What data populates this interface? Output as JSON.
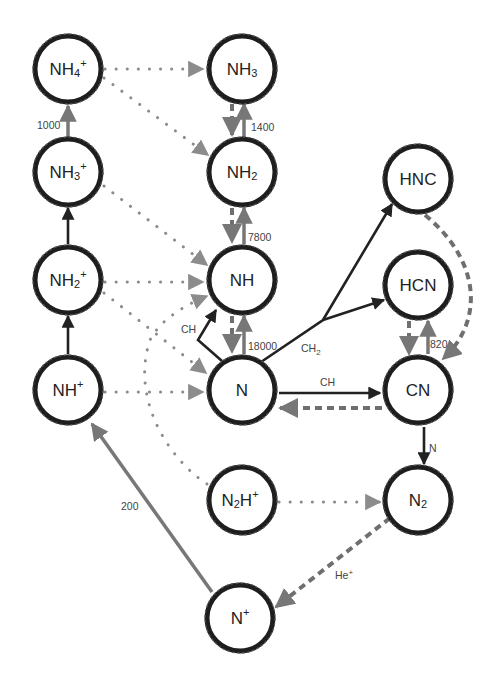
{
  "diagram": {
    "nodes": [
      {
        "id": "NH4+",
        "base": "NH",
        "sub": "4",
        "sup": "+",
        "x": 68,
        "y": 69
      },
      {
        "id": "NH3",
        "base": "NH",
        "sub": "3",
        "sup": "",
        "x": 242,
        "y": 69
      },
      {
        "id": "NH3+",
        "base": "NH",
        "sub": "3",
        "sup": "+",
        "x": 68,
        "y": 172
      },
      {
        "id": "NH2",
        "base": "NH",
        "sub": "2",
        "sup": "",
        "x": 242,
        "y": 172
      },
      {
        "id": "HNC",
        "base": "HNC",
        "sub": "",
        "sup": "",
        "x": 418,
        "y": 179
      },
      {
        "id": "NH2+",
        "base": "NH",
        "sub": "2",
        "sup": "+",
        "x": 68,
        "y": 280
      },
      {
        "id": "NH",
        "base": "NH",
        "sub": "",
        "sup": "",
        "x": 242,
        "y": 280
      },
      {
        "id": "HCN",
        "base": "HCN",
        "sub": "",
        "sup": "",
        "x": 418,
        "y": 285
      },
      {
        "id": "NH+",
        "base": "NH",
        "sub": "",
        "sup": "+",
        "x": 68,
        "y": 390
      },
      {
        "id": "N",
        "base": "N",
        "sub": "",
        "sup": "",
        "x": 242,
        "y": 390
      },
      {
        "id": "CN",
        "base": "CN",
        "sub": "",
        "sup": "",
        "x": 418,
        "y": 390
      },
      {
        "id": "N2H+",
        "base": "N",
        "sub": "2",
        "sup": "H+",
        "x": 242,
        "y": 500
      },
      {
        "id": "N2",
        "base": "N",
        "sub": "2",
        "sup": "",
        "x": 418,
        "y": 500
      },
      {
        "id": "N+",
        "base": "N",
        "sub": "",
        "sup": "+",
        "x": 240,
        "y": 618
      }
    ],
    "edge_labels": {
      "nh3p_nh4p": "1000",
      "nh2_nh3": "1400",
      "nh_nh2": "7800",
      "n_nh": "18000",
      "n_nh_ch": "CH",
      "n_branch_ch2": "CH2",
      "n_cn_ch": "CH",
      "cn_hcn": "820",
      "cn_n2": "N",
      "np_nhp": "200",
      "n2_np": "He+"
    },
    "colors": {
      "node_ring": "#1e1e1e",
      "solid_black_edge": "#222222",
      "gray_edge": "#777777",
      "dotted_edge": "#8a8a8a",
      "dashed_edge": "#6f6f6f"
    },
    "legend_semantics": {
      "solid_black": "neutral-neutral reaction",
      "solid_gray": "ion-molecule with rate",
      "dotted": "dissociative recombination",
      "dashed": "photodissociation / destruction"
    }
  }
}
